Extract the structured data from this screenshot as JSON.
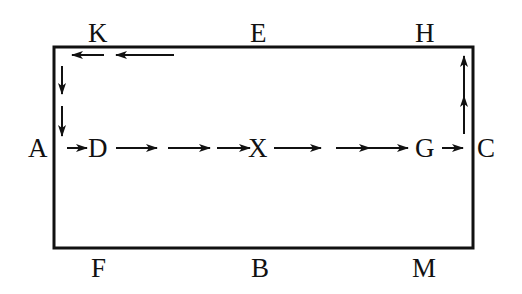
{
  "diagram": {
    "colors": {
      "stroke": "#111111",
      "background": "#ffffff"
    },
    "rectangle": {
      "x": 54,
      "y": 47,
      "width": 419,
      "height": 201
    },
    "labels": {
      "K": "K",
      "E": "E",
      "H": "H",
      "A": "A",
      "D": "D",
      "X": "X",
      "G": "G",
      "C": "C",
      "F": "F",
      "B": "B",
      "M": "M"
    },
    "flow": [
      {
        "from": "C",
        "to": "H",
        "direction": "up",
        "side": "right"
      },
      {
        "from": "H",
        "to": "K",
        "direction": "left",
        "side": "top"
      },
      {
        "from": "K",
        "to": "A",
        "direction": "down",
        "side": "left"
      },
      {
        "from": "A",
        "to": "C",
        "direction": "right",
        "path": [
          "D",
          "X",
          "G"
        ]
      }
    ]
  }
}
